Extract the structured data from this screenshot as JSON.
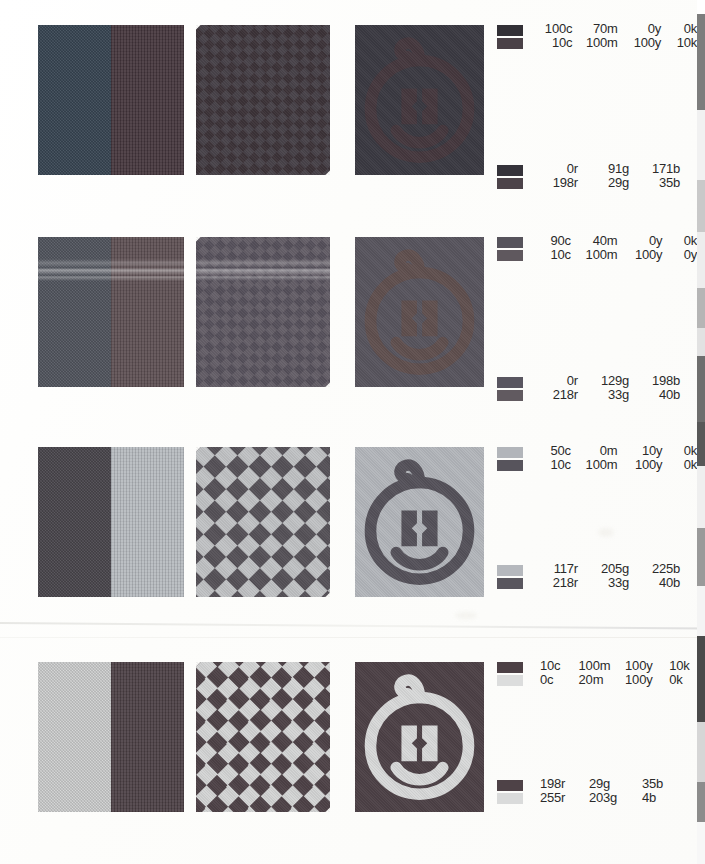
{
  "document": {
    "kind": "color-proof-test-chart",
    "page_width": 705,
    "page_height": 864
  },
  "rows": [
    {
      "id": "row-1",
      "top": 25,
      "swatch_a": "#2f4f6f",
      "swatch_b": "#4a3640",
      "split_left": "#3c4a57",
      "split_right": "#44353c",
      "weave_dark": "#3c3338",
      "weave_light": "#49434a",
      "logo_bg": "#3b3a42",
      "logo_fg": "#45383e",
      "cmyk": [
        {
          "c": "100c",
          "m": "70m",
          "y": "0y",
          "k": "0k"
        },
        {
          "c": "10c",
          "m": "100m",
          "y": "100y",
          "k": "10k"
        }
      ],
      "rgb": [
        {
          "r": "0r",
          "g": "91g",
          "b": "171b"
        },
        {
          "r": "198r",
          "g": "29g",
          "b": "35b"
        }
      ],
      "rgb_top": 140,
      "cmyk_swatch_a": "#323036",
      "cmyk_swatch_b": "#4a4147",
      "rgb_swatch_a": "#35333a",
      "rgb_swatch_b": "#4c4349"
    },
    {
      "id": "row-2",
      "top": 237,
      "swatch_a": "#4a4e5c",
      "swatch_b": "#54464c",
      "split_left": "#565a63",
      "split_right": "#5c4e52",
      "weave_dark": "#55505a",
      "weave_light": "#666069",
      "logo_bg": "#58555e",
      "logo_fg": "#60504f",
      "cmyk": [
        {
          "c": "90c",
          "m": "40m",
          "y": "0y",
          "k": "0k"
        },
        {
          "c": "10c",
          "m": "100m",
          "y": "100y",
          "k": "0y"
        }
      ],
      "rgb": [
        {
          "r": "0r",
          "g": "129g",
          "b": "198b"
        },
        {
          "r": "218r",
          "g": "33g",
          "b": "40b"
        }
      ],
      "rgb_top": 140,
      "cmyk_swatch_a": "#56535b",
      "cmyk_swatch_b": "#5f585e",
      "rgb_swatch_a": "#595660",
      "rgb_swatch_b": "#615a60"
    },
    {
      "id": "row-3",
      "top": 447,
      "swatch_a": "#b9bdc2",
      "swatch_b": "#4d4a50",
      "split_left": "#4e4b51",
      "split_right": "#b6babf",
      "weave_dark": "#565258",
      "weave_light": "#c0c2c4",
      "logo_bg": "#b3b6bb",
      "logo_fg": "#55525a",
      "cmyk": [
        {
          "c": "50c",
          "m": "0m",
          "y": "10y",
          "k": "0k"
        },
        {
          "c": "10c",
          "m": "100m",
          "y": "100y",
          "k": "0k"
        }
      ],
      "rgb": [
        {
          "r": "117r",
          "g": "205g",
          "b": "225b"
        },
        {
          "r": "218r",
          "g": "33g",
          "b": "40b"
        }
      ],
      "rgb_top": 118,
      "cmyk_swatch_a": "#b2b5ba",
      "cmyk_swatch_b": "#57545c",
      "rgb_swatch_a": "#b5b8bd",
      "rgb_swatch_b": "#59565e"
    },
    {
      "id": "row-4",
      "top": 662,
      "swatch_a": "#514348",
      "swatch_b": "#d9dadb",
      "split_left": "#d5d6d6",
      "split_right": "#4b3f44",
      "weave_dark": "#4e4247",
      "weave_light": "#d3d4d4",
      "logo_bg": "#4d4146",
      "logo_fg": "#d8d9d9",
      "cmyk": [
        {
          "c": "10c",
          "m": "100m",
          "y": "100y",
          "k": "10k"
        },
        {
          "c": "0c",
          "m": "20m",
          "y": "100y",
          "k": "0k"
        }
      ],
      "rgb": [
        {
          "r": "198r",
          "g": "29g",
          "b": "35b"
        },
        {
          "r": "255r",
          "g": "203g",
          "b": "4b"
        }
      ],
      "rgb_top": 118,
      "cmyk_swatch_a": "#4c4045",
      "cmyk_swatch_b": "#dcdddd",
      "rgb_swatch_a": "#4e4247",
      "rgb_swatch_b": "#dadbdb",
      "align": "left"
    }
  ],
  "strip": {
    "name": "calibration-strip",
    "segments": [
      {
        "color": "#ffffff",
        "h": 14
      },
      {
        "color": "#7d7d7d",
        "h": 96
      },
      {
        "color": "#f1f1f1",
        "h": 70
      },
      {
        "color": "#c9c9c9",
        "h": 52
      },
      {
        "color": "#ededed",
        "h": 56
      },
      {
        "color": "#b5b5b5",
        "h": 40
      },
      {
        "color": "#e2e2e2",
        "h": 28
      },
      {
        "color": "#6e6e6e",
        "h": 66
      },
      {
        "color": "#585858",
        "h": 44
      },
      {
        "color": "#efefef",
        "h": 62
      },
      {
        "color": "#9a9a9a",
        "h": 58
      },
      {
        "color": "#f4f4f4",
        "h": 50
      },
      {
        "color": "#4a4a4a",
        "h": 86
      },
      {
        "color": "#d6d6d6",
        "h": 60
      },
      {
        "color": "#8c8c8c",
        "h": 40
      },
      {
        "color": "#f7f7f7",
        "h": 42
      }
    ]
  }
}
